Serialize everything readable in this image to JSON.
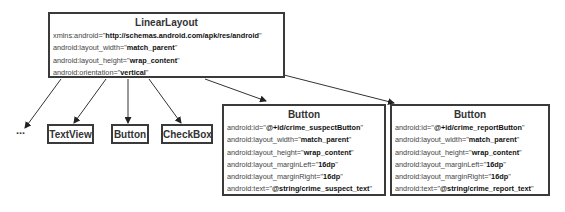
{
  "root": {
    "title": "LinearLayout",
    "attrs": [
      {
        "name": "xmlns:android=\"",
        "value": "http://schemas.android.com/apk/res/android",
        "close": "\""
      },
      {
        "name": "android:layout_width=\"",
        "value": "match_parent",
        "close": "\""
      },
      {
        "name": "android:layout_height=\"",
        "value": "wrap_content",
        "close": "\""
      },
      {
        "name": "android:orientation=\"",
        "value": "vertical",
        "close": "\""
      }
    ]
  },
  "children": {
    "ellipsis": "...",
    "textview": "TextView",
    "button": "Button",
    "checkbox": "CheckBox"
  },
  "suspect_button": {
    "title": "Button",
    "attrs": [
      {
        "name": "android:id=\"",
        "value": "@+id/crime_suspectButton",
        "close": "\""
      },
      {
        "name": "android:layout_width=\"",
        "value": "match_parent",
        "close": "\""
      },
      {
        "name": "android:layout_height=\"",
        "value": "wrap_content",
        "close": "\""
      },
      {
        "name": "android:layout_marginLeft=\"",
        "value": "16dp",
        "close": "\""
      },
      {
        "name": "android:layout_marginRight=\"",
        "value": "16dp",
        "close": "\""
      },
      {
        "name": "android:text=\"",
        "value": "@string/crime_suspect_text",
        "close": "\""
      }
    ]
  },
  "report_button": {
    "title": "Button",
    "attrs": [
      {
        "name": "android:id=\"",
        "value": "@+id/crime_reportButton",
        "close": "\""
      },
      {
        "name": "android:layout_width=\"",
        "value": "match_parent",
        "close": "\""
      },
      {
        "name": "android:layout_height=\"",
        "value": "wrap_content",
        "close": "\""
      },
      {
        "name": "android:layout_marginLeft=\"",
        "value": "16dp",
        "close": "\""
      },
      {
        "name": "android:layout_marginRight=\"",
        "value": "16dp",
        "close": "\""
      },
      {
        "name": "android:text=\"",
        "value": "@string/crime_report_text",
        "close": "\""
      }
    ]
  }
}
